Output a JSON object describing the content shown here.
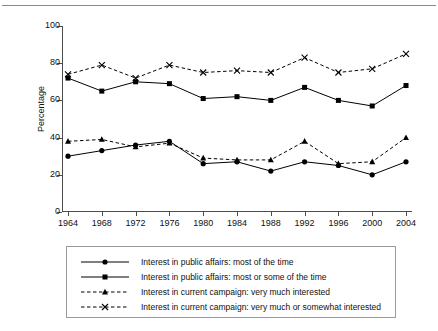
{
  "caption": {
    "clipped_text": ""
  },
  "chart_data": {
    "type": "line",
    "title": "",
    "xlabel": "",
    "ylabel": "Percentage",
    "xlim": [
      1964,
      2004
    ],
    "ylim": [
      0,
      100
    ],
    "grid": false,
    "legend_position": "bottom",
    "categories": [
      1964,
      1968,
      1972,
      1976,
      1980,
      1984,
      1988,
      1992,
      1996,
      2000,
      2004
    ],
    "xtick_labels": [
      "1964",
      "1968",
      "1972",
      "1976",
      "1980",
      "1984",
      "1988",
      "1992",
      "1996",
      "2000",
      "2004"
    ],
    "ytick_labels": [
      "0",
      "20",
      "40",
      "60",
      "80",
      "100"
    ],
    "ytick_values": [
      0,
      20,
      40,
      60,
      80,
      100
    ],
    "series": [
      {
        "name": "Interest in public affairs: most of the time",
        "marker": "circle",
        "line": "solid",
        "color": "#000000",
        "values": [
          30,
          33,
          36,
          38,
          26,
          27,
          22,
          27,
          25,
          20,
          27
        ]
      },
      {
        "name": "Interest in public affairs: most or some of the time",
        "marker": "square",
        "line": "solid",
        "color": "#000000",
        "values": [
          72,
          65,
          70,
          69,
          61,
          62,
          60,
          67,
          60,
          57,
          68
        ]
      },
      {
        "name": "Interest in current campaign: very much interested",
        "marker": "triangle",
        "line": "dashed",
        "color": "#000000",
        "values": [
          38,
          39,
          35,
          37,
          29,
          28,
          28,
          38,
          26,
          27,
          40
        ]
      },
      {
        "name": "Interest in current campaign: very much or somewhat interested",
        "marker": "cross",
        "line": "dashed",
        "color": "#000000",
        "values": [
          74,
          79,
          72,
          79,
          75,
          76,
          75,
          83,
          75,
          77,
          85
        ]
      }
    ]
  }
}
